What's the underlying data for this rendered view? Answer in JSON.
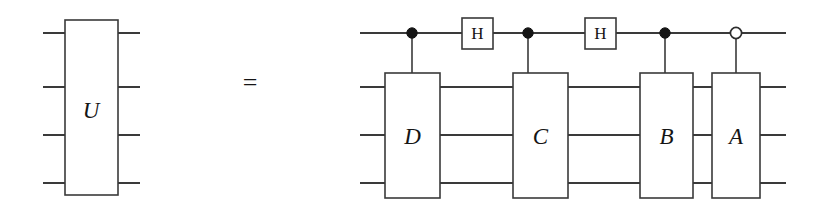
{
  "figure": {
    "kind": "quantum-circuit-identity",
    "background_color": "#ffffff",
    "line_color": "#3a3a3a",
    "ink_color": "#151515",
    "width": 827,
    "height": 212
  },
  "relation": {
    "operator_label": "=",
    "operator_x": 250,
    "operator_y": 82
  },
  "left_circuit": {
    "name": "unitary-block",
    "gate": {
      "label": "U",
      "x": 65,
      "y": 20,
      "width": 53,
      "height": 175,
      "label_x": 91,
      "label_y": 110
    },
    "wires": [
      {
        "label": "wire-0",
        "y": 33,
        "x1": 43,
        "x2": 140
      },
      {
        "label": "wire-1",
        "y": 87,
        "x1": 43,
        "x2": 140
      },
      {
        "label": "wire-2",
        "y": 135,
        "x1": 43,
        "x2": 140
      },
      {
        "label": "wire-3",
        "y": 183,
        "x1": 43,
        "x2": 140
      }
    ]
  },
  "right_circuit": {
    "name": "decomposed-circuit",
    "wire_start_x": 360,
    "wire_end_x": 786,
    "wires": [
      {
        "label": "control-wire",
        "y": 33,
        "x1": 360,
        "x2": 786
      },
      {
        "label": "target-wire-1",
        "y": 87,
        "x1": 360,
        "x2": 786
      },
      {
        "label": "target-wire-2",
        "y": 135,
        "x1": 360,
        "x2": 786
      },
      {
        "label": "target-wire-3",
        "y": 183,
        "x1": 360,
        "x2": 786
      }
    ],
    "controls": [
      {
        "label": "control-d",
        "type": "filled",
        "x": 412,
        "y": 33,
        "r": 5.2,
        "drop_to": 73
      },
      {
        "label": "control-c",
        "type": "filled",
        "x": 528,
        "y": 33,
        "r": 5.2,
        "drop_to": 73
      },
      {
        "label": "control-b",
        "type": "filled",
        "x": 665,
        "y": 33,
        "r": 5.2,
        "drop_to": 73
      },
      {
        "label": "control-a",
        "type": "open",
        "x": 736,
        "y": 33,
        "r": 5.6,
        "drop_to": 73
      }
    ],
    "h_gates": [
      {
        "label": "H",
        "x": 462,
        "y": 18,
        "width": 31,
        "height": 31,
        "label_x": 477.5,
        "label_y": 33.5
      },
      {
        "label": "H",
        "x": 585,
        "y": 18,
        "width": 31,
        "height": 31,
        "label_x": 600.5,
        "label_y": 33.5
      }
    ],
    "multi_gates": [
      {
        "label": "D",
        "x": 385,
        "y": 73,
        "width": 55,
        "height": 125,
        "label_x": 412.5,
        "label_y": 136
      },
      {
        "label": "C",
        "x": 513,
        "y": 73,
        "width": 55,
        "height": 125,
        "label_x": 540.5,
        "label_y": 136
      },
      {
        "label": "B",
        "x": 640,
        "y": 73,
        "width": 53,
        "height": 125,
        "label_x": 666.5,
        "label_y": 136
      },
      {
        "label": "A",
        "x": 712,
        "y": 73,
        "width": 48,
        "height": 125,
        "label_x": 736.0,
        "label_y": 136
      }
    ]
  }
}
